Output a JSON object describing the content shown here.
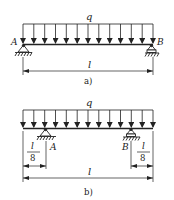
{
  "colors": {
    "ink": "#222222",
    "background": "#ffffff"
  },
  "figure_a": {
    "load_label": "q",
    "support_left_label": "A",
    "support_right_label": "B",
    "span_label": "l",
    "caption": "a)",
    "load_arrow_count": 13
  },
  "figure_b": {
    "load_label": "q",
    "support_left_label": "A",
    "support_right_label": "B",
    "span_label": "l",
    "overhang_left": {
      "numerator": "l",
      "denominator": "8"
    },
    "overhang_right": {
      "numerator": "l",
      "denominator": "8"
    },
    "caption": "b)",
    "load_arrow_count": 13
  }
}
